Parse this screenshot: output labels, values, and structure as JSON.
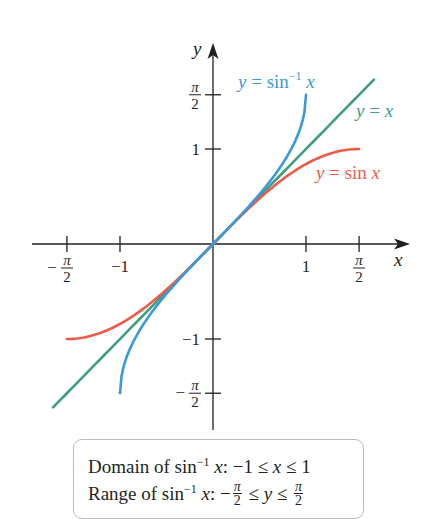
{
  "chart_data": {
    "type": "line",
    "title": "",
    "xlabel": "x",
    "ylabel": "y",
    "xlim": [
      -1.95,
      2.1
    ],
    "ylim": [
      -1.95,
      2.1
    ],
    "grid": false,
    "x_ticks": [
      {
        "value": -1.5708,
        "label_num": "π",
        "label_den": "2",
        "sign": "−",
        "fraction": true
      },
      {
        "value": -1,
        "label": "−1",
        "fraction": false
      },
      {
        "value": 1,
        "label": "1",
        "fraction": false
      },
      {
        "value": 1.5708,
        "label_num": "π",
        "label_den": "2",
        "sign": "",
        "fraction": true
      }
    ],
    "y_ticks": [
      {
        "value": 1.5708,
        "label_num": "π",
        "label_den": "2",
        "sign": "",
        "fraction": true
      },
      {
        "value": 1,
        "label": "1",
        "fraction": false
      },
      {
        "value": -1,
        "label": "−1",
        "fraction": false
      },
      {
        "value": -1.5708,
        "label_num": "π",
        "label_den": "2",
        "sign": "−",
        "fraction": true
      }
    ],
    "series": [
      {
        "name": "y = x",
        "function": "identity",
        "domain": [
          -1.72,
          1.73
        ],
        "color": "#3f9e7c",
        "x": [
          -1.72,
          1.73
        ],
        "y": [
          -1.72,
          1.73
        ]
      },
      {
        "name": "y = sin x",
        "function": "sin",
        "domain": [
          -1.5708,
          1.5708
        ],
        "color": "#ef5b4b",
        "x": [
          -1.5708,
          -1.3,
          -1.0,
          -0.7,
          -0.4,
          0,
          0.4,
          0.7,
          1.0,
          1.3,
          1.5708
        ],
        "y": [
          -1,
          -0.9636,
          -0.8415,
          -0.6442,
          -0.3894,
          0,
          0.3894,
          0.6442,
          0.8415,
          0.9636,
          1
        ]
      },
      {
        "name": "y = sin⁻¹ x",
        "function": "arcsin",
        "domain": [
          -1,
          1
        ],
        "color": "#3a9ad9",
        "x": [
          -1,
          -0.98,
          -0.9,
          -0.7,
          -0.4,
          0,
          0.4,
          0.7,
          0.9,
          0.98,
          1
        ],
        "y": [
          -1.5708,
          -1.3705,
          -1.1198,
          -0.7754,
          -0.4115,
          0,
          0.4115,
          0.7754,
          1.1198,
          1.3705,
          1.5708
        ]
      }
    ],
    "annotations": [
      {
        "text": "Domain of sin⁻¹ x: −1 ≤ x ≤ 1"
      },
      {
        "text": "Range of sin⁻¹ x: −π/2 ≤ y ≤ π/2"
      }
    ]
  },
  "labels": {
    "x_axis": "x",
    "y_axis": "y",
    "arcsin": {
      "pre": "y = sin",
      "sup": "−1",
      "post": " x",
      "color": "#3a9ad9"
    },
    "identity": {
      "text": "y = x",
      "color": "#3f9e7c"
    },
    "sine": {
      "text": "y = sin x",
      "color": "#ef5b4b"
    }
  },
  "info": {
    "domain": {
      "pre": "Domain of sin",
      "sup": "−1",
      "var": "x",
      "rest": ": −1 ≤ ",
      "v2": "x",
      "end": " ≤ 1"
    },
    "range": {
      "pre": "Range of sin",
      "sup": "−1",
      "var": "x",
      "rest": ": −",
      "frac_num": "π",
      "frac_den": "2",
      "mid": " ≤ ",
      "v2": "y",
      "le": " ≤ ",
      "frac2_num": "π",
      "frac2_den": "2"
    }
  }
}
